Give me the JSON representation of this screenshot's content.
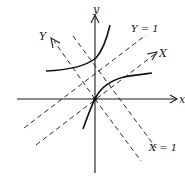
{
  "diagram": {
    "type": "coordinate-rotation-hyperbola",
    "labels": {
      "x_axis": "x",
      "y_axis": "y",
      "X_axis": "X",
      "Y_axis": "Y",
      "Y_equals_1": "Y = 1",
      "X_equals_1": "X = 1"
    },
    "colors": {
      "ink": "#1a1a1a",
      "background": "#ffffff"
    }
  }
}
